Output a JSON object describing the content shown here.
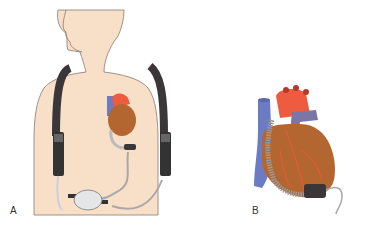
{
  "figure": {
    "panels": [
      {
        "id": "A",
        "label": "A",
        "description": "Patient wearing ventricular assist device with shoulder harness, batteries and external controller"
      },
      {
        "id": "B",
        "label": "B",
        "description": "Close-up of heart with implanted left ventricular assist device and driveline"
      }
    ]
  },
  "colors": {
    "skin": "#f8dfc8",
    "outline": "#8a7a70",
    "strap": "#3b3637",
    "heart": "#b3662f",
    "aorta": "#ee5b3e",
    "vein": "#6d7cc2",
    "device": "#9a9a9a",
    "controller": "#e4e6e8",
    "cable": "#a8a8a8",
    "vessel_line": "#f0553a"
  }
}
